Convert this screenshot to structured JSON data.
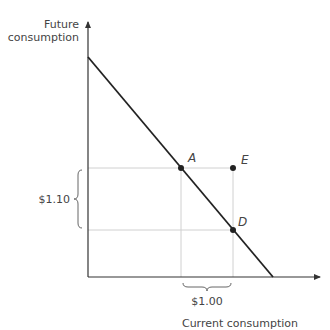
{
  "diagram": {
    "type": "intertemporal-budget-constraint",
    "y_axis_label_line1": "Future",
    "y_axis_label_line2": "consumption",
    "x_axis_label": "Current consumption",
    "points": [
      {
        "id": "A",
        "label": "A",
        "on_budget_line": true
      },
      {
        "id": "E",
        "label": "E",
        "on_budget_line": false
      },
      {
        "id": "D",
        "label": "D",
        "on_budget_line": true
      }
    ],
    "vertical_brace_label": "$1.10",
    "horizontal_brace_label": "$1.00",
    "colors": {
      "budget_line": "#222222",
      "axes": "#333333",
      "guide_lines": "#d0d0d0",
      "text": "#444444"
    }
  }
}
